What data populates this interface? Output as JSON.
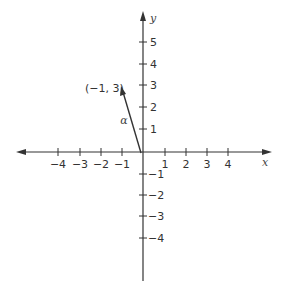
{
  "diagram": {
    "type": "coordinate-plane-vector",
    "axes": {
      "x_label": "x",
      "y_label": "y",
      "x_ticks": [
        {
          "value": -4,
          "label": "−4"
        },
        {
          "value": -3,
          "label": "−3"
        },
        {
          "value": -2,
          "label": "−2"
        },
        {
          "value": -1,
          "label": "−1"
        },
        {
          "value": 1,
          "label": "1"
        },
        {
          "value": 2,
          "label": "2"
        },
        {
          "value": 3,
          "label": "3"
        },
        {
          "value": 4,
          "label": "4"
        }
      ],
      "y_ticks": [
        {
          "value": 5,
          "label": "5"
        },
        {
          "value": 4,
          "label": "4"
        },
        {
          "value": 3,
          "label": "3"
        },
        {
          "value": 2,
          "label": "2"
        },
        {
          "value": 1,
          "label": "1"
        },
        {
          "value": -1,
          "label": "−1"
        },
        {
          "value": -2,
          "label": "−2"
        },
        {
          "value": -3,
          "label": "−3"
        },
        {
          "value": -4,
          "label": "−4"
        }
      ]
    },
    "vector": {
      "name": "α",
      "from": [
        0,
        0
      ],
      "to": [
        -1,
        3
      ],
      "endpoint_label": "(−1, 3)"
    },
    "colors": {
      "line": "#333333",
      "background": "#ffffff"
    }
  }
}
